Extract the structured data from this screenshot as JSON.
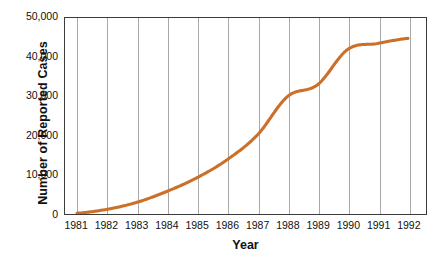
{
  "chart_data": {
    "type": "line",
    "title": "",
    "xlabel": "Year",
    "ylabel": "Number of Reported Cases",
    "x": [
      1981,
      1982,
      1983,
      1984,
      1985,
      1986,
      1987,
      1988,
      1989,
      1990,
      1991,
      1992
    ],
    "categories": [
      "1981",
      "1982",
      "1983",
      "1984",
      "1985",
      "1986",
      "1987",
      "1988",
      "1989",
      "1990",
      "1991",
      "1992"
    ],
    "values": [
      200,
      1200,
      3000,
      5800,
      9300,
      13900,
      20200,
      30000,
      33000,
      42000,
      43500,
      44800
    ],
    "series": [
      {
        "name": "Reported Cases",
        "color": "#CC6F28",
        "values": [
          200,
          1200,
          3000,
          5800,
          9300,
          13900,
          20200,
          30000,
          33000,
          42000,
          43500,
          44800
        ]
      }
    ],
    "ylim": [
      0,
      50000
    ],
    "xlim": [
      1980.6,
      1992.6
    ],
    "ytick_labels": [
      "0",
      "10,000",
      "20,000",
      "30,000",
      "40,000",
      "50,000"
    ],
    "ytick_values": [
      0,
      10000,
      20000,
      30000,
      40000,
      50000
    ],
    "xtick_labels": [
      "1981",
      "1982",
      "1983",
      "1984",
      "1985",
      "1986",
      "1987",
      "1988",
      "1989",
      "1990",
      "1991",
      "1992"
    ],
    "grid": "vertical-only",
    "legend": "none",
    "line_color": "#CC6F28",
    "axis_color": "#3B3B3B",
    "grid_color": "#A8A8A8"
  }
}
